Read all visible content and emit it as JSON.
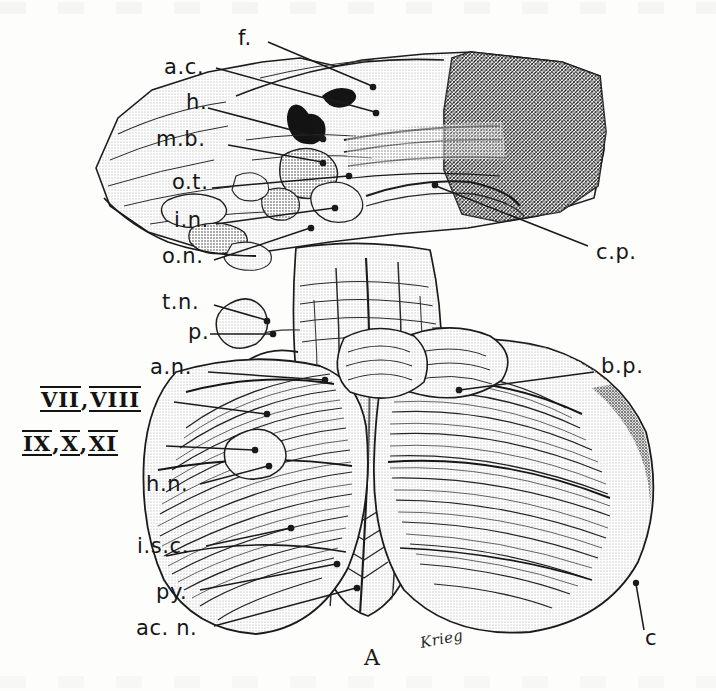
{
  "figure": {
    "domain": "anatomical-illustration",
    "panel_label": "A",
    "artist_signature": "Krieg",
    "background_color": "#fdfdfc",
    "ink_color": "#161616",
    "media": "halftone line engraving"
  },
  "labels": {
    "left": [
      {
        "key": "ac",
        "text": "a.c.",
        "x": 164,
        "y": 68,
        "anchor_x": 375,
        "anchor_y": 112
      },
      {
        "key": "h",
        "text": "h.",
        "x": 185,
        "y": 103,
        "anchor_x": 320,
        "anchor_y": 140
      },
      {
        "key": "mb",
        "text": "m.b.",
        "x": 155,
        "y": 140,
        "anchor_x": 320,
        "anchor_y": 163
      },
      {
        "key": "ot",
        "text": "o.t.",
        "x": 170,
        "y": 183,
        "anchor_x": 345,
        "anchor_y": 177
      },
      {
        "key": "in",
        "text": "i.n.",
        "x": 172,
        "y": 222,
        "anchor_x": 330,
        "anchor_y": 206
      },
      {
        "key": "on",
        "text": "o.n.",
        "x": 160,
        "y": 258,
        "anchor_x": 305,
        "anchor_y": 228
      },
      {
        "key": "tn",
        "text": "t.n.",
        "x": 160,
        "y": 303,
        "anchor_x": 262,
        "anchor_y": 318
      },
      {
        "key": "p",
        "text": "p.",
        "x": 186,
        "y": 333,
        "anchor_x": 268,
        "anchor_y": 333
      },
      {
        "key": "an",
        "text": "a.n.",
        "x": 148,
        "y": 368,
        "anchor_x": 320,
        "anchor_y": 378
      },
      {
        "key": "hn",
        "text": "h.n.",
        "x": 145,
        "y": 486,
        "anchor_x": 262,
        "anchor_y": 466
      },
      {
        "key": "isc",
        "text": "i.s.c.",
        "x": 136,
        "y": 547,
        "anchor_x": 285,
        "anchor_y": 528
      },
      {
        "key": "py",
        "text": "py.",
        "x": 155,
        "y": 594,
        "anchor_x": 330,
        "anchor_y": 566
      },
      {
        "key": "acn",
        "text": "ac. n.",
        "x": 135,
        "y": 630,
        "anchor_x": 352,
        "anchor_y": 590
      }
    ],
    "roman": [
      {
        "key": "vii_viii",
        "parts": [
          "VII",
          "VIII"
        ],
        "separator": ",",
        "x": 40,
        "y": 396,
        "anchor_x": 262,
        "anchor_y": 412
      },
      {
        "key": "ix_x_xi",
        "parts": [
          "IX",
          "X",
          "XI"
        ],
        "separator": ",",
        "x": 22,
        "y": 440,
        "anchor_x": 250,
        "anchor_y": 448
      }
    ],
    "right": [
      {
        "key": "cp",
        "text": "c.p.",
        "x": 595,
        "y": 253,
        "anchor_x": 432,
        "anchor_y": 186
      },
      {
        "key": "bp",
        "text": "b.p.",
        "x": 600,
        "y": 367,
        "anchor_x": 456,
        "anchor_y": 388
      },
      {
        "key": "c",
        "text": "c",
        "x": 644,
        "y": 638,
        "anchor_x": 638,
        "anchor_y": 586
      }
    ]
  },
  "panel": {
    "label": "A",
    "x": 364,
    "y": 655
  },
  "signature": {
    "text": "Krieg",
    "x": 418,
    "y": 642
  }
}
